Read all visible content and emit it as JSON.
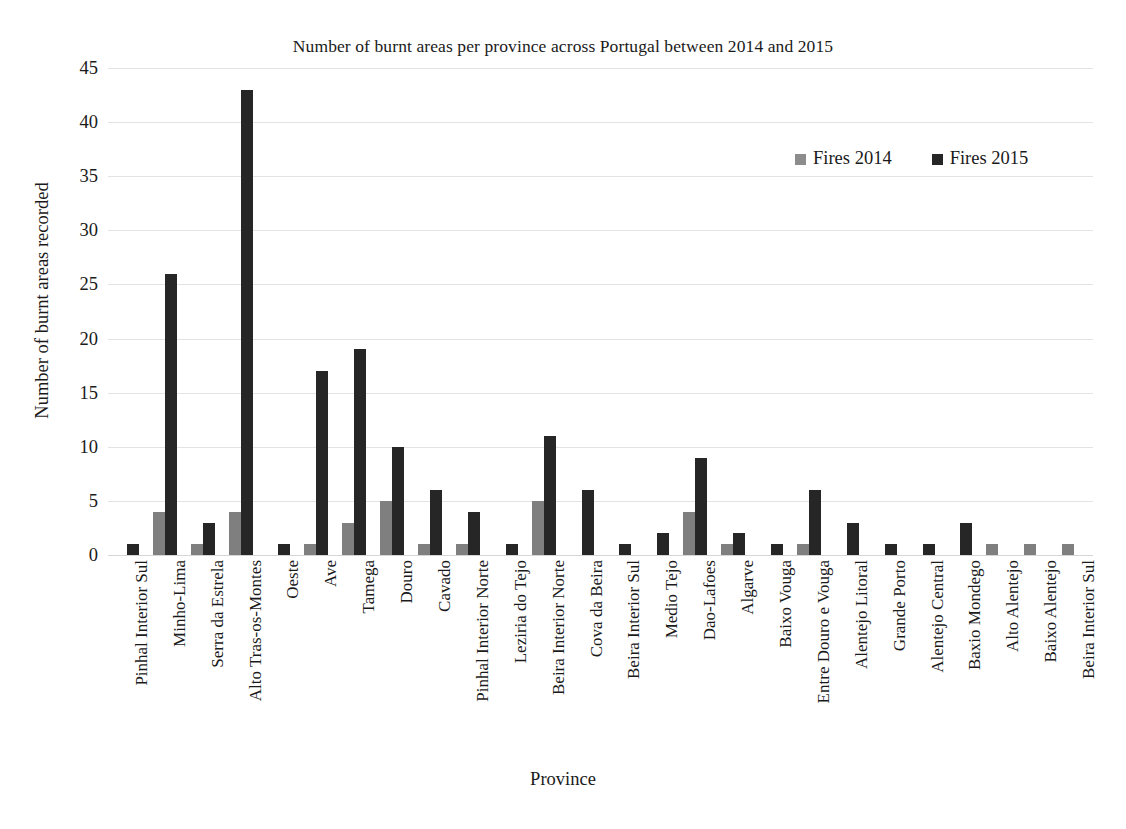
{
  "chart_data": {
    "type": "bar",
    "title": "Number of burnt areas per province across Portugal between 2014 and 2015",
    "xlabel": "Province",
    "ylabel": "Number of burnt areas recorded",
    "ylim": [
      0,
      45
    ],
    "yticks": [
      0,
      5,
      10,
      15,
      20,
      25,
      30,
      35,
      40,
      45
    ],
    "grid": true,
    "legend_position": "top-right",
    "categories": [
      "Pinhal Interior Sul",
      "Minho-Lima",
      "Serra da Estrela",
      "Alto Tras-os-Montes",
      "Oeste",
      "Ave",
      "Tamega",
      "Douro",
      "Cavado",
      "Pinhal Interior Norte",
      "Leziria do Tejo",
      "Beira Interior Norte",
      "Cova da Beira",
      "Beira Interior Sul",
      "Medio Tejo",
      "Dao-Lafoes",
      "Algarve",
      "Baixo Vouga",
      "Entre Douro e Vouga",
      "Alentejo Litoral",
      "Grande Porto",
      "Alentejo Central",
      "Baxio Mondego",
      "Alto Alentejo",
      "Baixo Alentejo",
      "Beira Interior Sul"
    ],
    "series": [
      {
        "name": "Fires 2014",
        "color": "#7f7f7f",
        "values": [
          0,
          4,
          1,
          4,
          0,
          1,
          3,
          5,
          1,
          1,
          0,
          5,
          0,
          0,
          0,
          4,
          1,
          0,
          1,
          0,
          0,
          0,
          0,
          1,
          1,
          1
        ]
      },
      {
        "name": "Fires 2015",
        "color": "#262626",
        "values": [
          1,
          26,
          3,
          43,
          1,
          17,
          19,
          10,
          6,
          4,
          1,
          11,
          6,
          1,
          2,
          9,
          2,
          1,
          6,
          3,
          1,
          1,
          3,
          0,
          0,
          0
        ]
      }
    ]
  },
  "legend": {
    "items": [
      {
        "label": "Fires 2014",
        "swatch": "series-2014-swatch"
      },
      {
        "label": "Fires 2015",
        "swatch": "series-2015-swatch"
      }
    ]
  }
}
